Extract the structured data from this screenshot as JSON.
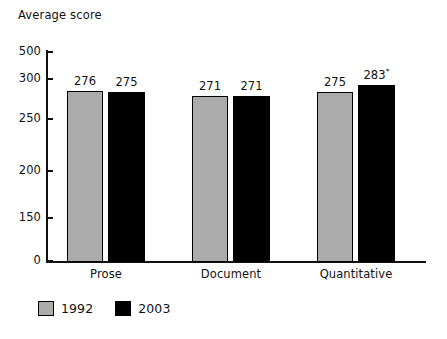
{
  "chart_data": {
    "type": "bar",
    "title": "",
    "subtitle": "",
    "ylabel": "Average score",
    "xlabel": "",
    "categories": [
      "Prose",
      "Document",
      "Quantitative"
    ],
    "series": [
      {
        "name": "1992",
        "color": "#ababab",
        "values": [
          276,
          271,
          275
        ],
        "labels": [
          "276",
          "271",
          "275"
        ]
      },
      {
        "name": "2003",
        "color": "#000000",
        "values": [
          275,
          271,
          283
        ],
        "labels": [
          "275",
          "271",
          "283"
        ]
      }
    ],
    "annotations": [
      {
        "series": "2003",
        "category": "Quantitative",
        "marker": "*",
        "note": "significance marker on 283"
      }
    ],
    "yticks": [
      0,
      150,
      200,
      250,
      300,
      500
    ],
    "ytick_labels": [
      "0",
      "150",
      "200",
      "250",
      "300",
      "500"
    ],
    "ylim": [
      0,
      500
    ],
    "axis_note": "broken / non-linear y axis: 500 drawn just above 300",
    "grid": false,
    "legend_position": "bottom-left",
    "legend_entries": [
      "1992",
      "2003"
    ]
  },
  "axis": {
    "y_title": "Average score",
    "ticks": [
      {
        "label": "500",
        "y": 52
      },
      {
        "label": "300",
        "y": 79
      },
      {
        "label": "250",
        "y": 119
      },
      {
        "label": "200",
        "y": 171
      },
      {
        "label": "150",
        "y": 218
      },
      {
        "label": "0",
        "y": 261
      }
    ]
  },
  "bars": [
    {
      "name": "prose-1992",
      "series": "1992",
      "category": "Prose",
      "label": "276",
      "sup": "",
      "x": 67,
      "w": 36,
      "top": 91
    },
    {
      "name": "prose-2003",
      "series": "2003",
      "category": "Prose",
      "label": "275",
      "sup": "",
      "x": 108,
      "w": 37,
      "top": 92
    },
    {
      "name": "document-1992",
      "series": "1992",
      "category": "Document",
      "label": "271",
      "sup": "",
      "x": 192,
      "w": 36,
      "top": 96
    },
    {
      "name": "document-2003",
      "series": "2003",
      "category": "Document",
      "label": "271",
      "sup": "",
      "x": 233,
      "w": 37,
      "top": 96
    },
    {
      "name": "quantitative-1992",
      "series": "1992",
      "category": "Quantitative",
      "label": "275",
      "sup": "",
      "x": 317,
      "w": 36,
      "top": 92
    },
    {
      "name": "quantitative-2003",
      "series": "2003",
      "category": "Quantitative",
      "label": "283",
      "sup": "*",
      "x": 358,
      "w": 37,
      "top": 85
    }
  ],
  "categories": [
    {
      "label": "Prose",
      "center": 106
    },
    {
      "label": "Document",
      "center": 231
    },
    {
      "label": "Quantitative",
      "center": 356
    }
  ],
  "legend": {
    "items": [
      {
        "label": "1992",
        "swatch": "sw-1992",
        "color": "#ababab"
      },
      {
        "label": "2003",
        "swatch": "sw-2003",
        "color": "#000000"
      }
    ]
  }
}
